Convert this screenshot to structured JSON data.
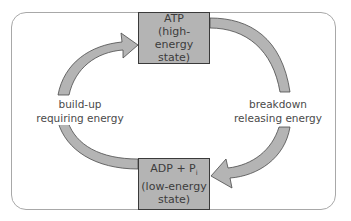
{
  "diagram": {
    "type": "cycle",
    "nodes": [
      {
        "id": "atp",
        "line1": "ATP",
        "line2": "(high-energy",
        "line3": "state)"
      },
      {
        "id": "adp",
        "line1_main": "ADP + P",
        "line1_sub": "i",
        "line2": "(low-energy",
        "line3": "state)"
      }
    ],
    "edges": [
      {
        "from": "adp",
        "to": "atp",
        "side": "left",
        "label_line1": "build-up",
        "label_line2": "requiring energy"
      },
      {
        "from": "atp",
        "to": "adp",
        "side": "right",
        "label_line1": "breakdown",
        "label_line2": "releasing energy"
      }
    ],
    "colors": {
      "box_fill": "#b4b4b4",
      "arrow_fill": "#b4b4b4",
      "frame": "#a8a8a8",
      "text": "#4a4a4a"
    }
  }
}
